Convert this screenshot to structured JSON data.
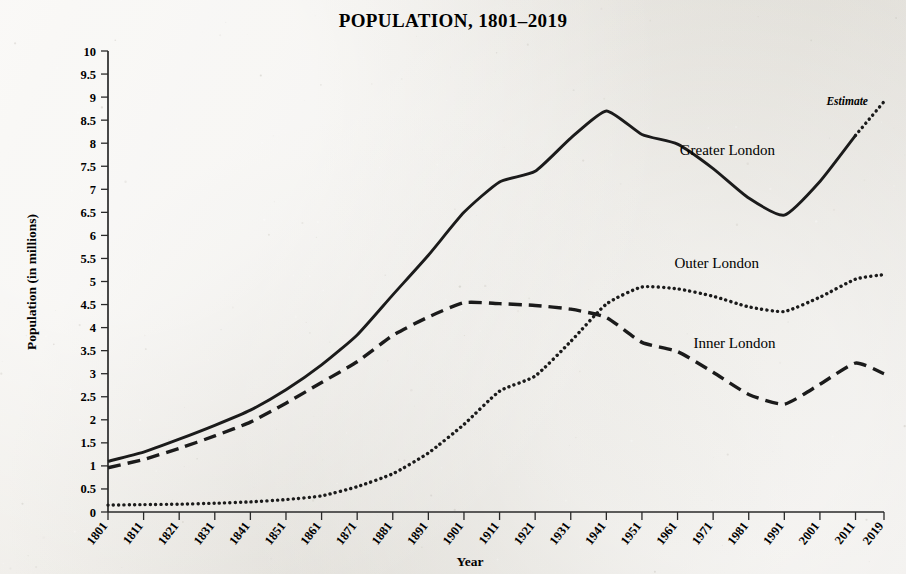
{
  "chart_data": {
    "type": "line",
    "title": "POPULATION, 1801–2019",
    "xlabel": "Year",
    "ylabel": "Population (in millions)",
    "xlim": [
      1801,
      2019
    ],
    "ylim": [
      0,
      10
    ],
    "grid": false,
    "legend_position": "inline-labels",
    "x": [
      1801,
      1811,
      1821,
      1831,
      1841,
      1851,
      1861,
      1871,
      1881,
      1891,
      1901,
      1911,
      1921,
      1931,
      1941,
      1951,
      1961,
      1971,
      1981,
      1991,
      2001,
      2011,
      2019
    ],
    "xtick_labels": [
      "1801",
      "1811",
      "1821",
      "1831",
      "1841",
      "1851",
      "1861",
      "1871",
      "1881",
      "1891",
      "1901",
      "1911",
      "1921",
      "1931",
      "1941",
      "1951",
      "1961",
      "1971",
      "1981",
      "1991",
      "2001",
      "2011",
      "2019"
    ],
    "ytick_labels": [
      "0",
      "0.5",
      "1",
      "1.5",
      "2",
      "2.5",
      "3",
      "3.5",
      "4",
      "4.5",
      "5",
      "5.5",
      "6",
      "6.5",
      "7",
      "7.5",
      "8",
      "8.5",
      "9",
      "9.5",
      "10"
    ],
    "ytick_values": [
      0,
      0.5,
      1,
      1.5,
      2,
      2.5,
      3,
      3.5,
      4,
      4.5,
      5,
      5.5,
      6,
      6.5,
      7,
      7.5,
      8,
      8.5,
      9,
      9.5,
      10
    ],
    "annotations": [
      {
        "text": "Estimate",
        "x": 2014.5,
        "y": 8.82,
        "style": "italic"
      }
    ],
    "series": [
      {
        "name": "Greater London",
        "style": "solid",
        "label_x": 1975,
        "label_y": 7.75,
        "estimate_from": 2011,
        "values": [
          1.1,
          1.3,
          1.58,
          1.88,
          2.21,
          2.65,
          3.19,
          3.84,
          4.71,
          5.57,
          6.5,
          7.16,
          7.39,
          8.11,
          8.7,
          8.19,
          7.98,
          7.45,
          6.81,
          6.44,
          7.17,
          8.17,
          8.9
        ]
      },
      {
        "name": "Inner London",
        "style": "dashed",
        "label_x": 1977,
        "label_y": 3.55,
        "values": [
          0.96,
          1.14,
          1.38,
          1.65,
          1.95,
          2.36,
          2.81,
          3.26,
          3.83,
          4.23,
          4.54,
          4.52,
          4.48,
          4.4,
          4.22,
          3.68,
          3.48,
          3.03,
          2.55,
          2.34,
          2.77,
          3.23,
          3.0
        ]
      },
      {
        "name": "Outer London",
        "style": "dotted",
        "label_x": 1972,
        "label_y": 5.3,
        "values": [
          0.15,
          0.16,
          0.17,
          0.19,
          0.22,
          0.27,
          0.35,
          0.55,
          0.83,
          1.28,
          1.9,
          2.62,
          2.95,
          3.7,
          4.51,
          4.88,
          4.84,
          4.68,
          4.45,
          4.35,
          4.66,
          5.05,
          5.15
        ]
      }
    ]
  }
}
